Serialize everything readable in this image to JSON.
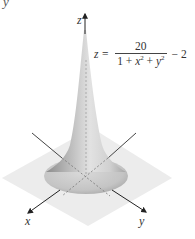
{
  "figure": {
    "corner_fragment": "y",
    "axes": {
      "z_label": "z",
      "x_label": "x",
      "y_label": "y"
    },
    "equation": {
      "lhs": "z =",
      "numerator": "20",
      "denominator_parts": [
        "1 + ",
        "x",
        "2",
        " + ",
        "y",
        "2"
      ],
      "tail": "− 2",
      "full_text": "z = 20 / (1 + x² + y²) − 2"
    },
    "colors": {
      "surface_light": "#e8e8e8",
      "surface_mid": "#b9b9b9",
      "surface_dark": "#8a8a8a",
      "plane": "#ececec",
      "axis": "#333333"
    }
  }
}
